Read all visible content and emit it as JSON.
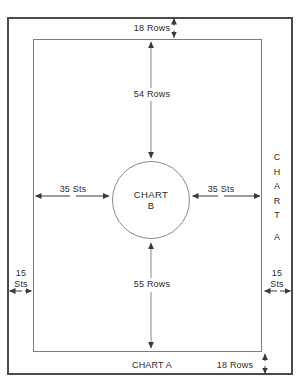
{
  "diagram": {
    "type": "schematic",
    "outer_panel": {
      "name": "outer border",
      "border_color": "#4a4a4a"
    },
    "inner_panel": {
      "name": "inner border",
      "border_color": "#7d7d7d"
    },
    "center": {
      "shape": "circle",
      "line1": "CHART",
      "line2": "B"
    },
    "measurements": {
      "top_rows": "18 Rows",
      "top_inner_rows": "54 Rows",
      "left_sts": "35 Sts",
      "right_sts": "35 Sts",
      "bottom_inner_rows": "55 Rows",
      "bottom_rows": "18 Rows",
      "left_margin_line1": "15",
      "left_margin_line2": "Sts",
      "right_margin_line1": "15",
      "right_margin_line2": "Sts"
    },
    "labels": {
      "bottom_chart": "CHART A",
      "right_chart_letters": [
        "C",
        "H",
        "A",
        "R",
        "T",
        "",
        "A"
      ]
    },
    "colors": {
      "ink": "#2b2b2b",
      "outer_border": "#4a4a4a",
      "inner_border": "#7d7d7d",
      "arrow": "#3a3a3a"
    }
  }
}
